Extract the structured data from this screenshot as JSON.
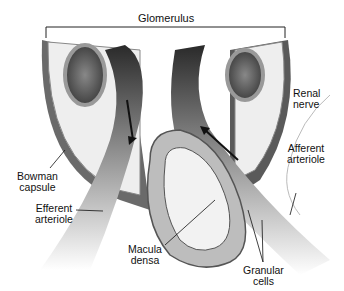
{
  "diagram": {
    "title_label": "Glomerulus",
    "labels": {
      "renal_nerve": "Renal\nnerve",
      "afferent_arteriole": "Afferent\narteriole",
      "bowman_capsule": "Bowman\ncapsule",
      "efferent_arteriole": "Efferent\narteriole",
      "macula_densa": "Macula\ndensa",
      "granular_cells": "Granular\ncells"
    },
    "colors": {
      "vessel_dark": "#3a3a3a",
      "cell_gray": "#a0a0a0",
      "lumen_light": "#f0f0f0"
    }
  }
}
